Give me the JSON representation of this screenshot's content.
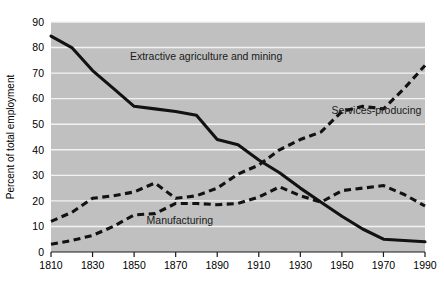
{
  "chart_data": {
    "type": "line",
    "title": "",
    "xlabel": "",
    "ylabel": "Percent of total employment",
    "xlim": [
      1810,
      1990
    ],
    "ylim": [
      0,
      90
    ],
    "grid": true,
    "legend": "inline-annotations",
    "x_ticks": [
      1810,
      1830,
      1850,
      1870,
      1890,
      1910,
      1930,
      1950,
      1970,
      1990
    ],
    "y_ticks": [
      0,
      10,
      20,
      30,
      40,
      50,
      60,
      70,
      80,
      90
    ],
    "x": [
      1810,
      1820,
      1830,
      1840,
      1850,
      1860,
      1870,
      1880,
      1890,
      1900,
      1910,
      1920,
      1930,
      1940,
      1950,
      1960,
      1970,
      1980,
      1990
    ],
    "series": [
      {
        "name": "Extractive agriculture and mining",
        "style": "solid",
        "label_x": 1848,
        "label_y": 75,
        "values": [
          84.5,
          80.0,
          71.0,
          64.0,
          57.0,
          56.0,
          55.0,
          53.5,
          44.0,
          42.0,
          36.0,
          31.0,
          25.0,
          19.5,
          14.0,
          9.0,
          5.0,
          4.5,
          4.0
        ]
      },
      {
        "name": "Services-producing",
        "style": "dashed",
        "label_x": 1945,
        "label_y": 54,
        "values": [
          12.0,
          15.5,
          21.0,
          22.0,
          23.5,
          27.0,
          21.0,
          22.0,
          25.0,
          30.5,
          34.0,
          40.0,
          44.0,
          47.0,
          55.0,
          57.0,
          56.0,
          64.0,
          73.0
        ]
      },
      {
        "name": "Manufacturing",
        "style": "dashed",
        "label_x": 1856,
        "label_y": 11,
        "values": [
          3.0,
          4.5,
          6.5,
          10.0,
          14.5,
          15.0,
          19.0,
          19.0,
          18.5,
          19.0,
          21.5,
          25.5,
          22.0,
          19.5,
          24.0,
          25.0,
          26.0,
          22.5,
          18.0
        ]
      }
    ]
  }
}
